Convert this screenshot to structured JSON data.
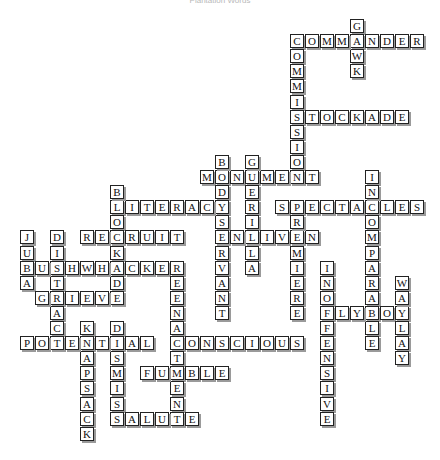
{
  "title": "Plantation Words",
  "grid": {
    "origin_x": 20,
    "origin_y": 19,
    "pitch_x": 15,
    "pitch_y": 15.1
  },
  "words": [
    {
      "word": "GAWK",
      "row": 0,
      "col": 22,
      "dir": "down"
    },
    {
      "word": "COMMANDER",
      "row": 1,
      "col": 18,
      "dir": "across"
    },
    {
      "word": "COMMISSION",
      "row": 1,
      "col": 18,
      "dir": "down"
    },
    {
      "word": "STOCKADE",
      "row": 6,
      "col": 18,
      "dir": "across"
    },
    {
      "word": "MONUMENT",
      "row": 10,
      "col": 12,
      "dir": "across"
    },
    {
      "word": "BODYSERVANT",
      "row": 9,
      "col": 13,
      "dir": "down"
    },
    {
      "word": "GUERILLA",
      "row": 9,
      "col": 15,
      "dir": "down"
    },
    {
      "word": "LITERACY",
      "row": 12,
      "col": 6,
      "dir": "across"
    },
    {
      "word": "SPECTACLES",
      "row": 12,
      "col": 17,
      "dir": "across"
    },
    {
      "word": "INCOMPARABLE",
      "row": 10,
      "col": 23,
      "dir": "down"
    },
    {
      "word": "BLOCKADE",
      "row": 11,
      "col": 6,
      "dir": "down"
    },
    {
      "word": "RECRUIT",
      "row": 14,
      "col": 4,
      "dir": "across"
    },
    {
      "word": "ENLIVEN",
      "row": 14,
      "col": 13,
      "dir": "across"
    },
    {
      "word": "PREMIERE",
      "row": 12,
      "col": 18,
      "dir": "down"
    },
    {
      "word": "JUBA",
      "row": 14,
      "col": 0,
      "dir": "down"
    },
    {
      "word": "DISTRACT",
      "row": 14,
      "col": 2,
      "dir": "down"
    },
    {
      "word": "BUSHWHACKER",
      "row": 16,
      "col": 0,
      "dir": "across"
    },
    {
      "word": "REENACTMENT",
      "row": 16,
      "col": 10,
      "dir": "down"
    },
    {
      "word": "GRIEVE",
      "row": 18,
      "col": 1,
      "dir": "across"
    },
    {
      "word": "INOFFENSIVE",
      "row": 16,
      "col": 20,
      "dir": "down"
    },
    {
      "word": "FLYBOY",
      "row": 19,
      "col": 20,
      "dir": "across"
    },
    {
      "word": "WAYLAY",
      "row": 17,
      "col": 25,
      "dir": "down"
    },
    {
      "word": "KNAPSACK",
      "row": 20,
      "col": 4,
      "dir": "down"
    },
    {
      "word": "DISMISS",
      "row": 20,
      "col": 6,
      "dir": "down"
    },
    {
      "word": "POTENTIAL",
      "row": 21,
      "col": 0,
      "dir": "across"
    },
    {
      "word": "CONSCIOUS",
      "row": 21,
      "col": 10,
      "dir": "across"
    },
    {
      "word": "FUMBLE",
      "row": 23,
      "col": 8,
      "dir": "across"
    },
    {
      "word": "SALUTE",
      "row": 26,
      "col": 6,
      "dir": "across"
    }
  ]
}
